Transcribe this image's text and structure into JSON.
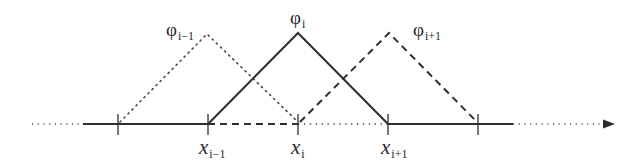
{
  "diagram": {
    "colors": {
      "line": "#2e2e2e",
      "text": "#2a2a2a",
      "background": "#ffffff"
    },
    "axis": {
      "y": 124,
      "solid_from": 83,
      "solid_to": 513,
      "dotted_left_from": 32,
      "dotted_right_to": 600,
      "arrow_tip": 614,
      "arrow": "right-arrow"
    },
    "nodes": [
      {
        "x": 118,
        "label_main": "",
        "label_sub": ""
      },
      {
        "x": 208,
        "label_main": "x",
        "label_sub": "i−1"
      },
      {
        "x": 298,
        "label_main": "x",
        "label_sub": "i"
      },
      {
        "x": 388,
        "label_main": "x",
        "label_sub": "i+1"
      },
      {
        "x": 478,
        "label_main": "",
        "label_sub": ""
      }
    ],
    "functions": [
      {
        "name": "phi-i-minus-1",
        "label_main": "φ",
        "label_sub": "i−1",
        "style": "dotted",
        "left": 118,
        "peak": 208,
        "right": 298,
        "peak_y": 35
      },
      {
        "name": "phi-i",
        "label_main": "φ",
        "label_sub": "i",
        "style": "solid",
        "left": 208,
        "peak": 298,
        "right": 388,
        "peak_y": 33
      },
      {
        "name": "phi-i-plus-1",
        "label_main": "φ",
        "label_sub": "i+1",
        "style": "dashed",
        "left": 298,
        "peak": 388,
        "right": 478,
        "peak_y": 33
      }
    ]
  }
}
